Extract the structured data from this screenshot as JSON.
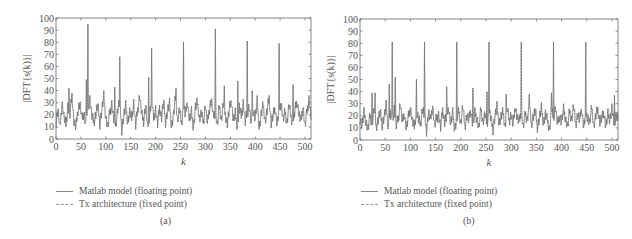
{
  "chart_data": [
    {
      "type": "line",
      "panel": "(a)",
      "title": "",
      "xlabel": "k",
      "ylabel": "|DFT{s(k)}|",
      "xlim": [
        0,
        512
      ],
      "ylim": [
        0,
        100
      ],
      "xticks": [
        0,
        50,
        100,
        150,
        200,
        250,
        300,
        350,
        400,
        450,
        500
      ],
      "yticks": [
        0,
        10,
        20,
        30,
        40,
        50,
        60,
        70,
        80,
        90,
        100
      ],
      "grid": false,
      "legend_position": "below",
      "series": [
        {
          "name": "Matlab model (floating point)",
          "style": "solid"
        },
        {
          "name": "Tx architecture (fixed point)",
          "style": "dashed"
        }
      ],
      "peaks": [
        {
          "k": 64,
          "value": 95
        },
        {
          "k": 128,
          "value": 68
        },
        {
          "k": 192,
          "value": 75
        },
        {
          "k": 256,
          "value": 80
        },
        {
          "k": 320,
          "value": 91
        },
        {
          "k": 384,
          "value": 81
        },
        {
          "k": 448,
          "value": 79
        }
      ],
      "secondary_spikes": [
        {
          "k": 26,
          "value": 42
        },
        {
          "k": 61,
          "value": 49
        },
        {
          "k": 118,
          "value": 43
        },
        {
          "k": 186,
          "value": 51
        },
        {
          "k": 241,
          "value": 42
        },
        {
          "k": 338,
          "value": 44
        },
        {
          "k": 365,
          "value": 48
        },
        {
          "k": 394,
          "value": 40
        },
        {
          "k": 476,
          "value": 45
        }
      ],
      "noise_floor_step": 4,
      "noise_floor": [
        14,
        25,
        8,
        31,
        18,
        12,
        27,
        20,
        36,
        15,
        9,
        24,
        30,
        17,
        22,
        11,
        26,
        33,
        19,
        14,
        21,
        28,
        13,
        24,
        35,
        18,
        10,
        22,
        29,
        16,
        12,
        25,
        31,
        8,
        19,
        27,
        14,
        22,
        17,
        30,
        11,
        24,
        36,
        20,
        15,
        28,
        9,
        21,
        33,
        17,
        25,
        12,
        26,
        18,
        31,
        14,
        23,
        29,
        10,
        20,
        34,
        16,
        24,
        13,
        27,
        19,
        31,
        15,
        22,
        9,
        26,
        30,
        17,
        21,
        14,
        28,
        12,
        25,
        33,
        18,
        23,
        11,
        27,
        16,
        29,
        20,
        13,
        24,
        32,
        15,
        21,
        10,
        26,
        19,
        30,
        14,
        22,
        27,
        12,
        24,
        17,
        31,
        9,
        20,
        28,
        15,
        23,
        34,
        13,
        19,
        26,
        11,
        25,
        30,
        16,
        22,
        14,
        28,
        18,
        12,
        24,
        31,
        20,
        15,
        27,
        10,
        23,
        33,
        19
      ]
    },
    {
      "type": "line",
      "panel": "(b)",
      "title": "",
      "xlabel": "k",
      "ylabel": "|DFT{s(k)}|",
      "xlim": [
        0,
        512
      ],
      "ylim": [
        0,
        100
      ],
      "xticks": [
        0,
        50,
        100,
        150,
        200,
        250,
        300,
        350,
        400,
        450,
        500
      ],
      "yticks": [
        0,
        10,
        20,
        30,
        40,
        50,
        60,
        70,
        80,
        90,
        100
      ],
      "grid": false,
      "legend_position": "below",
      "series": [
        {
          "name": "Matlab model (floating point)",
          "style": "solid"
        },
        {
          "name": "Tx architecture (fixed point)",
          "style": "dashed"
        }
      ],
      "peaks": [
        {
          "k": 64,
          "value": 81
        },
        {
          "k": 128,
          "value": 81
        },
        {
          "k": 192,
          "value": 81
        },
        {
          "k": 256,
          "value": 81
        },
        {
          "k": 320,
          "value": 81
        },
        {
          "k": 384,
          "value": 81
        },
        {
          "k": 448,
          "value": 81
        }
      ],
      "secondary_spikes": [
        {
          "k": 24,
          "value": 39
        },
        {
          "k": 30,
          "value": 39
        },
        {
          "k": 58,
          "value": 46
        },
        {
          "k": 70,
          "value": 52
        },
        {
          "k": 112,
          "value": 50
        },
        {
          "k": 172,
          "value": 44
        },
        {
          "k": 224,
          "value": 43
        },
        {
          "k": 252,
          "value": 40
        },
        {
          "k": 290,
          "value": 38
        },
        {
          "k": 336,
          "value": 38
        },
        {
          "k": 380,
          "value": 39
        },
        {
          "k": 505,
          "value": 37
        }
      ],
      "noise_floor_step": 4,
      "noise_floor": [
        18,
        12,
        22,
        15,
        9,
        20,
        14,
        25,
        11,
        17,
        23,
        13,
        19,
        28,
        10,
        21,
        16,
        26,
        12,
        18,
        30,
        14,
        22,
        9,
        19,
        27,
        15,
        11,
        24,
        17,
        13,
        26,
        20,
        8,
        23,
        16,
        29,
        12,
        18,
        21,
        10,
        25,
        15,
        19,
        27,
        13,
        22,
        9,
        17,
        24,
        14,
        28,
        11,
        20,
        16,
        25,
        12,
        22,
        18,
        10,
        26,
        15,
        21,
        13,
        24,
        17,
        9,
        20,
        27,
        14,
        19,
        23,
        11,
        26,
        16,
        21,
        12,
        28,
        18,
        15,
        25,
        10,
        22,
        17,
        29,
        13,
        20,
        24,
        11,
        18,
        26,
        14,
        21,
        16,
        9,
        23,
        19,
        27,
        12,
        20,
        15,
        25,
        18,
        11,
        24,
        17,
        28,
        13,
        21,
        16,
        26,
        10,
        22,
        19,
        14,
        27,
        12,
        20,
        25,
        15,
        18,
        23,
        11,
        21,
        17,
        26,
        14,
        20,
        19
      ]
    }
  ],
  "panels": {
    "a": {
      "xlabel": "k",
      "ylabel": "|DFT{s(k)}|",
      "legend": [
        "Matlab model (floating point)",
        "Tx architecture (fixed point)"
      ],
      "caption": "(a)"
    },
    "b": {
      "xlabel": "k",
      "ylabel": "|DFT{s(k)}|",
      "legend": [
        "Matlab model (floating point)",
        "Tx architecture (fixed point)"
      ],
      "caption": "(b)"
    }
  },
  "colors": {
    "line": "#6a6a6a",
    "axis": "#666666",
    "text": "#555555"
  }
}
